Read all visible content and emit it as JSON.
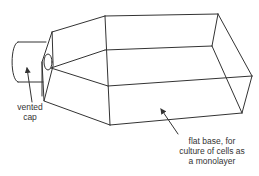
{
  "diagram": {
    "stroke_color": "#333333",
    "background": "#ffffff",
    "labels": {
      "cap": {
        "lines": [
          "vented",
          "cap"
        ]
      },
      "base": {
        "lines": [
          "flat base, for",
          "culture of cells as",
          "a monolayer"
        ]
      }
    },
    "components": [
      "vented-cap",
      "neck-flange",
      "neck-opening",
      "funnel-shoulder",
      "flask-body",
      "flat-base"
    ]
  }
}
